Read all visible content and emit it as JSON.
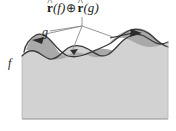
{
  "figure": {
    "title_label": {
      "name": "r-hat-f-oplus-r-hat-g",
      "r1": "r",
      "hat1": "^",
      "paren_f": "(f)",
      "operator": "⊕",
      "r2": "r",
      "hat2": "^",
      "paren_g": "(g)",
      "full_text": "r̂(f) ⊕ r̂(g)"
    },
    "curve_labels": {
      "g": "g",
      "f": "f"
    },
    "colors": {
      "background": "#ffffff",
      "terrain_fill": "#d2d2d2",
      "overlap_fill": "#a9a9a9",
      "curve_stroke": "#3a3a3a",
      "leader_line": "#6a6a6a",
      "frame_line": "#9a9a9a",
      "text": "#1b1b1b"
    },
    "geometry": {
      "canvas": {
        "width": 176,
        "height": 131
      },
      "plot_box": {
        "left": 22,
        "top": 28,
        "right": 168,
        "bottom": 119
      },
      "curve_f_description": "lower wavy boundary of light gray terrain region",
      "curve_g_description": "upper wavy curve crossing curve f, enclosing darker lens regions",
      "shaded_lobes": 3,
      "arrowheads": [
        {
          "name": "arrow-left-lobe",
          "direction": "left",
          "x": 38,
          "y": 40
        },
        {
          "name": "arrow-mid-lobe",
          "direction": "down",
          "x": 75,
          "y": 48
        },
        {
          "name": "arrow-right-lobe",
          "direction": "right",
          "x": 130,
          "y": 34
        }
      ],
      "leader_junction": {
        "x": 82,
        "y": 26
      }
    }
  }
}
